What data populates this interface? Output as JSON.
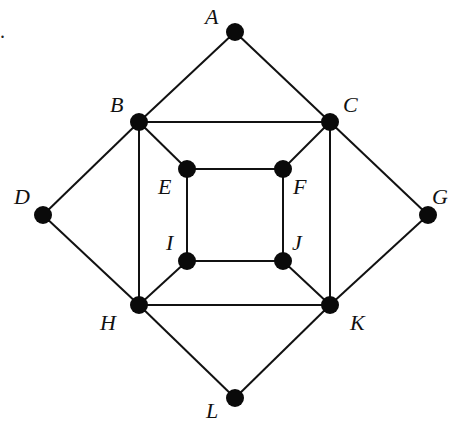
{
  "diagram": {
    "type": "graph",
    "marker": ".",
    "nodes": [
      {
        "id": "A",
        "label": "A",
        "x": 235,
        "y": 32,
        "lx": 205,
        "ly": 6
      },
      {
        "id": "B",
        "label": "B",
        "x": 139,
        "y": 122,
        "lx": 110,
        "ly": 94
      },
      {
        "id": "C",
        "label": "C",
        "x": 330,
        "y": 122,
        "lx": 343,
        "ly": 94
      },
      {
        "id": "D",
        "label": "D",
        "x": 43,
        "y": 215,
        "lx": 14,
        "ly": 186
      },
      {
        "id": "E",
        "label": "E",
        "x": 187,
        "y": 169,
        "lx": 158,
        "ly": 176
      },
      {
        "id": "F",
        "label": "F",
        "x": 283,
        "y": 169,
        "lx": 293,
        "ly": 176
      },
      {
        "id": "G",
        "label": "G",
        "x": 428,
        "y": 215,
        "lx": 432,
        "ly": 186
      },
      {
        "id": "H",
        "label": "H",
        "x": 139,
        "y": 305,
        "lx": 100,
        "ly": 312
      },
      {
        "id": "I",
        "label": "I",
        "x": 187,
        "y": 261,
        "lx": 166,
        "ly": 232
      },
      {
        "id": "J",
        "label": "J",
        "x": 283,
        "y": 261,
        "lx": 292,
        "ly": 232
      },
      {
        "id": "K",
        "label": "K",
        "x": 330,
        "y": 305,
        "lx": 350,
        "ly": 312
      },
      {
        "id": "L",
        "label": "L",
        "x": 235,
        "y": 398,
        "lx": 206,
        "ly": 400
      }
    ],
    "edges": [
      [
        "A",
        "B"
      ],
      [
        "A",
        "C"
      ],
      [
        "B",
        "C"
      ],
      [
        "B",
        "D"
      ],
      [
        "D",
        "H"
      ],
      [
        "C",
        "G"
      ],
      [
        "G",
        "K"
      ],
      [
        "B",
        "H"
      ],
      [
        "C",
        "K"
      ],
      [
        "H",
        "K"
      ],
      [
        "H",
        "L"
      ],
      [
        "K",
        "L"
      ],
      [
        "B",
        "E"
      ],
      [
        "C",
        "F"
      ],
      [
        "H",
        "I"
      ],
      [
        "K",
        "J"
      ],
      [
        "E",
        "F"
      ],
      [
        "F",
        "J"
      ],
      [
        "J",
        "I"
      ],
      [
        "I",
        "E"
      ]
    ]
  }
}
